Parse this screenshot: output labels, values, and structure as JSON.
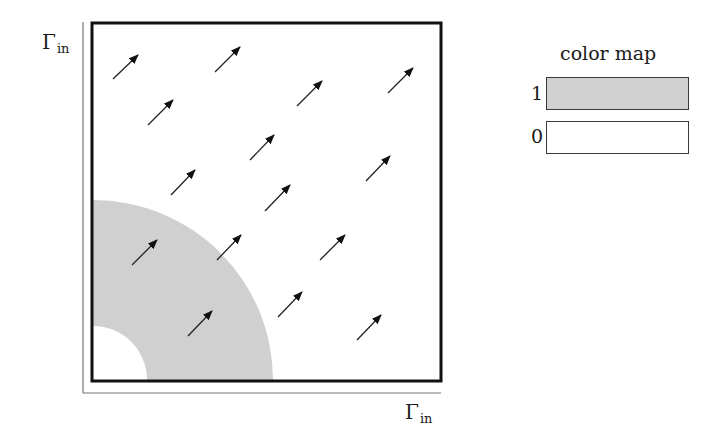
{
  "diagram": {
    "y_axis_label": {
      "main": "Γ",
      "sub": "in"
    },
    "x_axis_label": {
      "main": "Γ",
      "sub": "in"
    },
    "domain_box": {
      "x": 92,
      "y": 23,
      "w": 349,
      "h": 358
    },
    "annulus": {
      "cx": 93,
      "cy": 380,
      "r_outer": 180,
      "r_inner": 54,
      "fill": "#d0d0d0"
    },
    "arrows": [
      {
        "x1": 113,
        "y1": 79,
        "x2": 138,
        "y2": 55
      },
      {
        "x1": 215,
        "y1": 72,
        "x2": 240,
        "y2": 47
      },
      {
        "x1": 148,
        "y1": 125,
        "x2": 173,
        "y2": 100
      },
      {
        "x1": 297,
        "y1": 106,
        "x2": 322,
        "y2": 81
      },
      {
        "x1": 388,
        "y1": 93,
        "x2": 413,
        "y2": 68
      },
      {
        "x1": 250,
        "y1": 160,
        "x2": 274,
        "y2": 135
      },
      {
        "x1": 171,
        "y1": 195,
        "x2": 195,
        "y2": 170
      },
      {
        "x1": 265,
        "y1": 211,
        "x2": 290,
        "y2": 185
      },
      {
        "x1": 366,
        "y1": 181,
        "x2": 390,
        "y2": 156
      },
      {
        "x1": 132,
        "y1": 265,
        "x2": 157,
        "y2": 240
      },
      {
        "x1": 217,
        "y1": 260,
        "x2": 241,
        "y2": 235
      },
      {
        "x1": 320,
        "y1": 260,
        "x2": 345,
        "y2": 235
      },
      {
        "x1": 278,
        "y1": 317,
        "x2": 302,
        "y2": 292
      },
      {
        "x1": 188,
        "y1": 336,
        "x2": 212,
        "y2": 311
      },
      {
        "x1": 357,
        "y1": 340,
        "x2": 381,
        "y2": 315
      }
    ]
  },
  "color_map": {
    "title": "color map",
    "entries": [
      {
        "label": "1",
        "color": "#d0d0d0"
      },
      {
        "label": "0",
        "color": "#ffffff"
      }
    ]
  }
}
